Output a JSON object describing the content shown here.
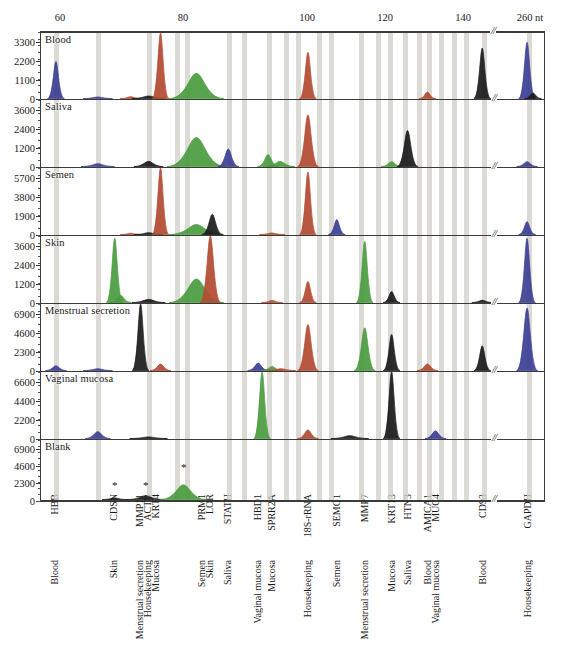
{
  "figure": {
    "type": "electropherogram-multipanel",
    "axis_unit": "nt",
    "x_axis": {
      "labels": [
        "60",
        "80",
        "100",
        "120",
        "140",
        "260 nt"
      ],
      "label_positions_px": [
        60,
        183,
        307,
        385,
        463,
        530
      ],
      "break_symbol": "//",
      "break_position_px": 496
    },
    "panels": [
      {
        "name": "Blood",
        "y_ticks": [
          "3300",
          "2200",
          "1100",
          "0"
        ],
        "ymax": 3900
      },
      {
        "name": "Saliva",
        "y_ticks": [
          "3600",
          "2400",
          "1200",
          "0"
        ],
        "ymax": 4250
      },
      {
        "name": "Semen",
        "y_ticks": [
          "5700",
          "3800",
          "1900",
          "0"
        ],
        "ymax": 6700
      },
      {
        "name": "Skin",
        "y_ticks": [
          "3600",
          "2400",
          "1200",
          "0"
        ],
        "ymax": 4250
      },
      {
        "name": "Menstrual secretion",
        "y_ticks": [
          "6900",
          "4600",
          "2300",
          "0"
        ],
        "ymax": 8100
      },
      {
        "name": "Vaginal mucosa",
        "y_ticks": [
          "6600",
          "4400",
          "2200",
          "0"
        ],
        "ymax": 7750
      },
      {
        "name": "Blank",
        "y_ticks": [
          "6900",
          "4600",
          "2300",
          "0"
        ],
        "ymax": 8100
      }
    ],
    "markers": {
      "note": "gray vertical bands = allelic-ladder / marker bins",
      "x_positions_px": [
        55,
        97,
        148,
        176,
        186,
        228,
        243,
        268,
        285,
        297,
        318,
        330,
        360,
        377,
        389,
        404,
        418,
        428,
        440,
        453,
        465,
        483,
        528
      ]
    },
    "genes": [
      {
        "label": "HBB",
        "fluid": "Blood",
        "x": 55
      },
      {
        "label": "CDSN",
        "fluid": "Skin",
        "x": 114
      },
      {
        "label": "MMP11",
        "fluid": "Menstrual secretion",
        "x": 140
      },
      {
        "label": "ACTB",
        "fluid": "Housekeeping",
        "x": 148
      },
      {
        "label": "KRT4",
        "fluid": "Mucosa",
        "x": 156
      },
      {
        "label": "PRM1",
        "fluid": "Semen",
        "x": 202
      },
      {
        "label": "LOR",
        "fluid": "Skin",
        "x": 210
      },
      {
        "label": "STATH",
        "fluid": "Saliva",
        "x": 228
      },
      {
        "label": "HBD1",
        "fluid": "Vaginal mucosa",
        "x": 258
      },
      {
        "label": "SPRR2A",
        "fluid": "Mucosa",
        "x": 272
      },
      {
        "label": "18S-rRNA",
        "fluid": "Housekeeping",
        "x": 308
      },
      {
        "label": "SEMG1",
        "fluid": "Semen",
        "x": 337
      },
      {
        "label": "MMP7",
        "fluid": "Menstrual secretion",
        "x": 365
      },
      {
        "label": "KRT13",
        "fluid": "Mucosa",
        "x": 392
      },
      {
        "label": "HTN3",
        "fluid": "Saliva",
        "x": 408
      },
      {
        "label": "AMICA1",
        "fluid": "Blood",
        "x": 428
      },
      {
        "label": "MUC4",
        "fluid": "Vaginal mucosa",
        "x": 436
      },
      {
        "label": "CD93",
        "fluid": "Blood",
        "x": 483
      },
      {
        "label": "GAPDH",
        "fluid": "Housekeeping",
        "x": 528
      }
    ],
    "asterisks": [
      {
        "x": 114,
        "panel": "Blank"
      },
      {
        "x": 145,
        "panel": "Blank"
      },
      {
        "x": 183,
        "panel": "Blank"
      }
    ],
    "colors": {
      "blue": "#3c3f93",
      "green": "#4a9b3f",
      "black": "#1a1a1a",
      "red": "#b34a30",
      "band": "#d2cfc8",
      "axis": "#3b3b3b"
    }
  },
  "chart_data": {
    "type": "line",
    "xlabel": "nt",
    "ylabel": "RFU",
    "xlim": [
      50,
      545
    ],
    "series": [
      {
        "name": "Blood",
        "ymax": 3900,
        "peaks": [
          {
            "x": 55,
            "h": 2200,
            "w": 4,
            "c": "blue"
          },
          {
            "x": 97,
            "h": 90,
            "w": 7,
            "c": "blue"
          },
          {
            "x": 130,
            "h": 110,
            "w": 5,
            "c": "red"
          },
          {
            "x": 148,
            "h": 150,
            "w": 8,
            "c": "black"
          },
          {
            "x": 160,
            "h": 3900,
            "w": 4,
            "c": "red"
          },
          {
            "x": 196,
            "h": 1500,
            "w": 13,
            "c": "green"
          },
          {
            "x": 308,
            "h": 2750,
            "w": 4,
            "c": "red"
          },
          {
            "x": 428,
            "h": 390,
            "w": 4,
            "c": "red"
          },
          {
            "x": 483,
            "h": 3000,
            "w": 4,
            "c": "black"
          },
          {
            "x": 528,
            "h": 3350,
            "w": 4,
            "c": "blue"
          },
          {
            "x": 534,
            "h": 330,
            "w": 4,
            "c": "black"
          }
        ]
      },
      {
        "name": "Saliva",
        "ymax": 4250,
        "peaks": [
          {
            "x": 97,
            "h": 180,
            "w": 8,
            "c": "blue"
          },
          {
            "x": 148,
            "h": 330,
            "w": 7,
            "c": "black"
          },
          {
            "x": 196,
            "h": 1850,
            "w": 14,
            "c": "green"
          },
          {
            "x": 228,
            "h": 1120,
            "w": 5,
            "c": "blue"
          },
          {
            "x": 268,
            "h": 760,
            "w": 5,
            "c": "green"
          },
          {
            "x": 280,
            "h": 330,
            "w": 7,
            "c": "green"
          },
          {
            "x": 308,
            "h": 3300,
            "w": 5,
            "c": "red"
          },
          {
            "x": 392,
            "h": 310,
            "w": 5,
            "c": "green"
          },
          {
            "x": 408,
            "h": 2300,
            "w": 5,
            "c": "black"
          },
          {
            "x": 528,
            "h": 310,
            "w": 5,
            "c": "blue"
          }
        ]
      },
      {
        "name": "Semen",
        "ymax": 6700,
        "peaks": [
          {
            "x": 130,
            "h": 130,
            "w": 5,
            "c": "red"
          },
          {
            "x": 148,
            "h": 180,
            "w": 7,
            "c": "black"
          },
          {
            "x": 160,
            "h": 6700,
            "w": 4,
            "c": "red"
          },
          {
            "x": 196,
            "h": 1000,
            "w": 13,
            "c": "green"
          },
          {
            "x": 212,
            "h": 2050,
            "w": 5,
            "c": "black"
          },
          {
            "x": 272,
            "h": 150,
            "w": 6,
            "c": "red"
          },
          {
            "x": 308,
            "h": 6300,
            "w": 4,
            "c": "red"
          },
          {
            "x": 337,
            "h": 1500,
            "w": 4,
            "c": "blue"
          },
          {
            "x": 528,
            "h": 1300,
            "w": 4,
            "c": "blue"
          }
        ]
      },
      {
        "name": "Skin",
        "ymax": 4250,
        "peaks": [
          {
            "x": 114,
            "h": 4100,
            "w": 4,
            "c": "green"
          },
          {
            "x": 120,
            "h": 450,
            "w": 5,
            "c": "green"
          },
          {
            "x": 148,
            "h": 200,
            "w": 8,
            "c": "black"
          },
          {
            "x": 196,
            "h": 1500,
            "w": 13,
            "c": "green"
          },
          {
            "x": 210,
            "h": 4250,
            "w": 5,
            "c": "red"
          },
          {
            "x": 272,
            "h": 130,
            "w": 5,
            "c": "red"
          },
          {
            "x": 308,
            "h": 1350,
            "w": 4,
            "c": "red"
          },
          {
            "x": 365,
            "h": 3900,
            "w": 4,
            "c": "green"
          },
          {
            "x": 392,
            "h": 700,
            "w": 4,
            "c": "black"
          },
          {
            "x": 483,
            "h": 140,
            "w": 5,
            "c": "black"
          },
          {
            "x": 528,
            "h": 4100,
            "w": 4,
            "c": "blue"
          }
        ]
      },
      {
        "name": "Menstrual secretion",
        "ymax": 8100,
        "peaks": [
          {
            "x": 55,
            "h": 580,
            "w": 5,
            "c": "blue"
          },
          {
            "x": 97,
            "h": 210,
            "w": 7,
            "c": "blue"
          },
          {
            "x": 140,
            "h": 8100,
            "w": 4,
            "c": "black"
          },
          {
            "x": 160,
            "h": 780,
            "w": 5,
            "c": "red"
          },
          {
            "x": 258,
            "h": 900,
            "w": 5,
            "c": "blue"
          },
          {
            "x": 272,
            "h": 490,
            "w": 5,
            "c": "green"
          },
          {
            "x": 281,
            "h": 220,
            "w": 7,
            "c": "red"
          },
          {
            "x": 308,
            "h": 5600,
            "w": 5,
            "c": "red"
          },
          {
            "x": 365,
            "h": 5200,
            "w": 5,
            "c": "green"
          },
          {
            "x": 392,
            "h": 4400,
            "w": 4,
            "c": "black"
          },
          {
            "x": 428,
            "h": 800,
            "w": 5,
            "c": "red"
          },
          {
            "x": 483,
            "h": 3000,
            "w": 4,
            "c": "black"
          },
          {
            "x": 528,
            "h": 7600,
            "w": 5,
            "c": "blue"
          }
        ]
      },
      {
        "name": "Vaginal mucosa",
        "ymax": 7750,
        "peaks": [
          {
            "x": 97,
            "h": 800,
            "w": 6,
            "c": "blue"
          },
          {
            "x": 148,
            "h": 180,
            "w": 9,
            "c": "black"
          },
          {
            "x": 262,
            "h": 7750,
            "w": 4,
            "c": "green"
          },
          {
            "x": 308,
            "h": 1000,
            "w": 5,
            "c": "red"
          },
          {
            "x": 350,
            "h": 330,
            "w": 9,
            "c": "black"
          },
          {
            "x": 392,
            "h": 7750,
            "w": 4,
            "c": "black"
          },
          {
            "x": 436,
            "h": 900,
            "w": 5,
            "c": "blue"
          }
        ]
      },
      {
        "name": "Blank",
        "ymax": 8100,
        "peaks": [
          {
            "x": 114,
            "h": 220,
            "w": 6,
            "c": "black"
          },
          {
            "x": 145,
            "h": 480,
            "w": 9,
            "c": "black"
          },
          {
            "x": 183,
            "h": 2000,
            "w": 11,
            "c": "green"
          }
        ]
      }
    ]
  }
}
